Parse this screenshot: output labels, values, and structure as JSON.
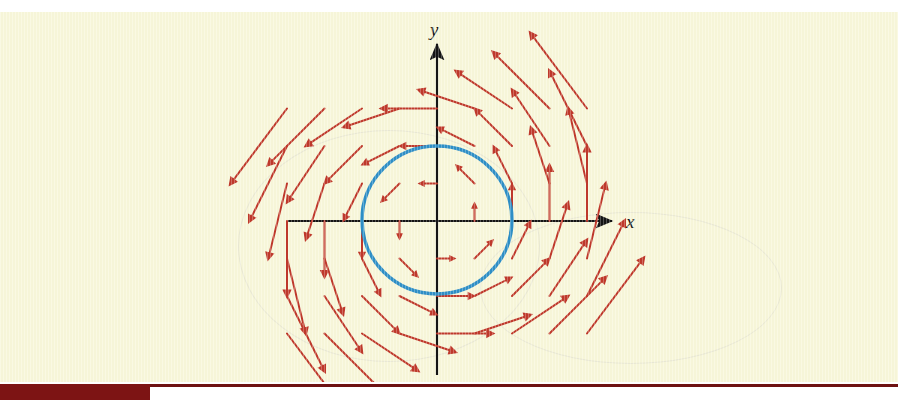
{
  "figure": {
    "kind": "vector-field-diagram",
    "background_color": "#f8f7da",
    "page_white": "#ffffff",
    "footer_bar_color": "#7d1414",
    "footer_rule_color": "#6e1212"
  },
  "axes": {
    "x_label": "x",
    "y_label": "y",
    "axis_color": "#141414",
    "x_axis": {
      "x1": 288,
      "y1": 221,
      "x2": 612,
      "y2": 221
    },
    "y_axis": {
      "x1": 437,
      "y1": 44,
      "x2": 437,
      "y2": 375
    },
    "x_label_pos": {
      "x": 626,
      "y": 228
    },
    "y_label_pos": {
      "x": 430,
      "y": 36
    }
  },
  "circle": {
    "name": "unit-circle-C",
    "color": "#2e8fc7",
    "stroke_width": 3.6,
    "center_x": 437,
    "center_y": 220,
    "radius_x": 75,
    "radius_y": 74
  },
  "chart_data": {
    "type": "quiver",
    "title": "",
    "xlabel": "x",
    "ylabel": "y",
    "grid": false,
    "legend": null,
    "field_formula": "F(x,y) = (-y, x)",
    "rotation": "counterclockwise",
    "arrow_color": "#c0392b",
    "arrow_head_length": 6,
    "xlim": [
      -2.6,
      2.6
    ],
    "ylim": [
      -2.0,
      2.0
    ],
    "sample_grid": {
      "x_values": [
        -2.0,
        -1.5,
        -1.0,
        -0.5,
        0.0,
        0.5,
        1.0,
        1.5,
        2.0
      ],
      "y_values": [
        -1.5,
        -1.0,
        -0.5,
        0.0,
        0.5,
        1.0,
        1.5
      ]
    },
    "origin_px": {
      "x": 437,
      "y": 221
    },
    "scale_px_per_unit": 75,
    "arrow_length_scale": 0.52,
    "arrows_note": "Each arrow at grid point (x,y) points along (-y, x); length grows with distance from origin."
  }
}
